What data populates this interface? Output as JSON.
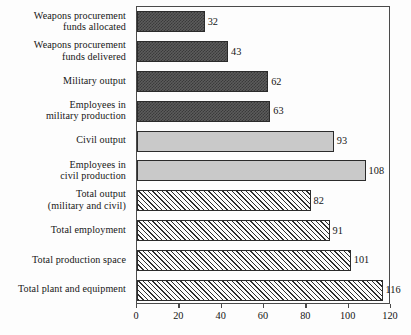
{
  "chart_data": {
    "type": "bar",
    "orientation": "horizontal",
    "title": "",
    "subtitle": "",
    "xlabel": "",
    "ylabel": "",
    "xlim": [
      0,
      120
    ],
    "ylim": null,
    "grid": false,
    "legend": null,
    "xticks": [
      0,
      20,
      40,
      60,
      80,
      100,
      120
    ],
    "xtick_labels": [
      "0",
      "20",
      "40",
      "60",
      "80",
      "100",
      "120"
    ],
    "categories": [
      "Weapons procurement funds allocated",
      "Weapons procurement funds delivered",
      "Military output",
      "Employees in military production",
      "Civil output",
      "Employees in civil production",
      "Total output (military and civil)",
      "Total employment",
      "Total production space",
      "Total plant and equipment"
    ],
    "values": [
      32,
      43,
      62,
      63,
      93,
      108,
      82,
      91,
      101,
      116
    ],
    "value_labels": [
      "32",
      "43",
      "62",
      "63",
      "93",
      "108",
      "82",
      "91",
      "101",
      "116"
    ],
    "bar_styles": [
      "dark-dither",
      "dark-dither",
      "dark-dither",
      "dark-dither",
      "solid-gray",
      "solid-gray",
      "diagonal-hatch",
      "diagonal-hatch",
      "diagonal-hatch",
      "diagonal-hatch"
    ],
    "bars": [
      {
        "label_lines": [
          "Weapons procurement",
          "funds allocated"
        ],
        "value": 32,
        "value_label": "32",
        "style": "dark-dither"
      },
      {
        "label_lines": [
          "Weapons procurement",
          "funds delivered"
        ],
        "value": 43,
        "value_label": "43",
        "style": "dark-dither"
      },
      {
        "label_lines": [
          "Military output"
        ],
        "value": 62,
        "value_label": "62",
        "style": "dark-dither"
      },
      {
        "label_lines": [
          "Employees in",
          "military production"
        ],
        "value": 63,
        "value_label": "63",
        "style": "dark-dither"
      },
      {
        "label_lines": [
          "Civil output"
        ],
        "value": 93,
        "value_label": "93",
        "style": "solid-gray"
      },
      {
        "label_lines": [
          "Employees in",
          "civil production"
        ],
        "value": 108,
        "value_label": "108",
        "style": "solid-gray"
      },
      {
        "label_lines": [
          "Total output",
          "(military and civil)"
        ],
        "value": 82,
        "value_label": "82",
        "style": "diagonal-hatch"
      },
      {
        "label_lines": [
          "Total employment"
        ],
        "value": 91,
        "value_label": "91",
        "style": "diagonal-hatch"
      },
      {
        "label_lines": [
          "Total production space"
        ],
        "value": 101,
        "value_label": "101",
        "style": "diagonal-hatch"
      },
      {
        "label_lines": [
          "Total plant and equipment"
        ],
        "value": 116,
        "value_label": "116",
        "style": "diagonal-hatch"
      }
    ],
    "colors": {
      "dark_fill": "#5c5c5c",
      "dark_pattern": "#3a3a3a",
      "gray_fill": "#c9c9c9",
      "hatch_line": "#2e2e2e",
      "hatch_background": "#fbfbfb",
      "bar_outline": "#2b2b2b",
      "frame": "#4a4a4a",
      "text": "#141414",
      "background": "#fdfdfd"
    }
  }
}
